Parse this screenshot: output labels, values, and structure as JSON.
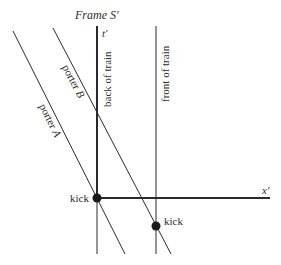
{
  "title": "Frame S′",
  "axes": {
    "t_label": "t′",
    "x_label": "x′"
  },
  "worldlines": [
    {
      "id": "porter-a",
      "label": "porter A",
      "label_main": "porter ",
      "label_var": "A"
    },
    {
      "id": "porter-b",
      "label": "porter B",
      "label_main": "porter ",
      "label_var": "B"
    },
    {
      "id": "back-of-train",
      "label": "back of train"
    },
    {
      "id": "front-of-train",
      "label": "front of train"
    }
  ],
  "events": [
    {
      "id": "kick-1",
      "label": "kick"
    },
    {
      "id": "kick-2",
      "label": "kick"
    }
  ],
  "colors": {
    "line": "#2a2a2a",
    "background": "#ffffff"
  }
}
